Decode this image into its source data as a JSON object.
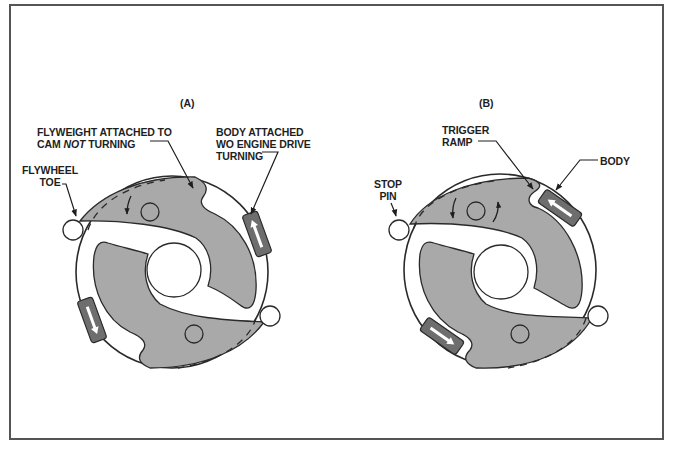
{
  "figure": {
    "panels": [
      {
        "id": "A",
        "title": "(A)",
        "labels": {
          "flyweight_line1": "FLYWEIGHT ATTACHED TO",
          "flyweight_line2_pre": "CAM ",
          "flyweight_line2_em": "NOT",
          "flyweight_line2_post": " TURNING",
          "body_line1": "BODY ATTACHED",
          "body_line2": "WO ENGINE DRIVE",
          "body_line3": "TURNING",
          "toe_line1": "FLYWHEEL",
          "toe_line2": "TOE"
        }
      },
      {
        "id": "B",
        "title": "(B)",
        "labels": {
          "trigger_line1": "TRIGGER",
          "trigger_line2": "RAMP",
          "body": "BODY",
          "stop_line1": "STOP",
          "stop_line2": "PIN"
        }
      }
    ],
    "colors": {
      "flyweight_fill": "#a9a9a9",
      "body_fill": "#6e6e6e",
      "outline": "#2a2a2a",
      "frame": "#555555"
    }
  }
}
